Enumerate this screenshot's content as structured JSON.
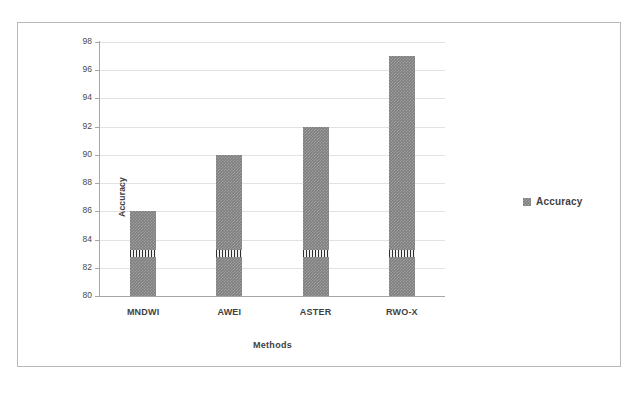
{
  "chart_data": {
    "type": "bar",
    "title": "",
    "xlabel": "Methods",
    "ylabel": "Accuracy",
    "categories": [
      "MNDWI",
      "AWEI",
      "ASTER",
      "RWO-X"
    ],
    "values": [
      86,
      90,
      92,
      97
    ],
    "series": [
      {
        "name": "Accuracy",
        "values": [
          86,
          90,
          92,
          97
        ]
      }
    ],
    "ylim": [
      80,
      98
    ],
    "ytick_step": 2,
    "yticks": [
      80,
      82,
      84,
      86,
      88,
      90,
      92,
      94,
      96,
      98
    ],
    "ytick_labels": [
      "80",
      "82",
      "84",
      "86",
      "88",
      "90",
      "92",
      "94",
      "96",
      "98"
    ],
    "grid": true,
    "grid_axis": "y",
    "legend": {
      "position": "right",
      "entries": [
        "Accuracy"
      ]
    },
    "colors": {
      "bar": "#7f7f7f",
      "gridline": "#e2e2e2",
      "axis": "#a6a6a6",
      "frame": "#b9b9b9",
      "text": "#3f3f3f",
      "background": "#ffffff"
    }
  }
}
